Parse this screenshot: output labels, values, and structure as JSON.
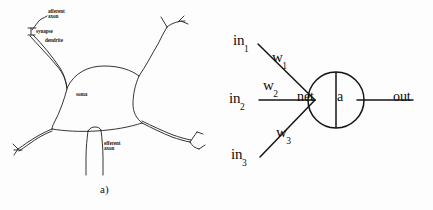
{
  "figure": {
    "width": 433,
    "height": 210,
    "background_color": "#fdfdfd",
    "ink_color": "#1a1a1a"
  },
  "panel_a": {
    "caption": "a)",
    "title": "biological neuron schematic",
    "labels": {
      "afferent_axon": "afferent\naxon",
      "synapse": "synapse",
      "dendrite": "dendrite",
      "soma": "soma",
      "efferent_axon": "efferent\naxon"
    }
  },
  "panel_b": {
    "caption": "b)",
    "title": "artificial neuron schematic",
    "inputs": [
      {
        "input_label": "in",
        "input_sub": "1",
        "weight_label": "w",
        "weight_sub": "1"
      },
      {
        "input_label": "in",
        "input_sub": "2",
        "weight_label": "w",
        "weight_sub": "2"
      },
      {
        "input_label": "in",
        "input_sub": "3",
        "weight_label": "w",
        "weight_sub": "3"
      }
    ],
    "node": {
      "left_cell": "net",
      "right_cell": "a"
    },
    "output_label": "out"
  }
}
